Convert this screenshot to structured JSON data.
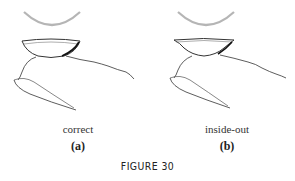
{
  "figure": {
    "title": "FIGURE 30",
    "panels": [
      {
        "id": "a",
        "caption": "correct",
        "label": "(a)"
      },
      {
        "id": "b",
        "caption": "inside-out",
        "label": "(b)"
      }
    ]
  },
  "colors": {
    "eye_arc": "#b5b5b5",
    "line": "#333333",
    "background": "#ffffff"
  }
}
